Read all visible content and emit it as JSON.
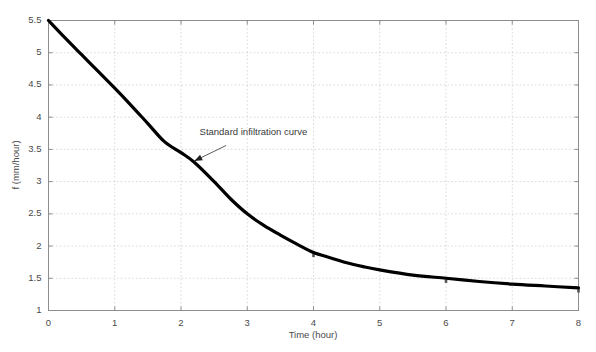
{
  "chart_data": {
    "type": "line",
    "title": "",
    "xlabel": "Time (hour)",
    "ylabel": "f (mm/hour)",
    "xlim": [
      0,
      8
    ],
    "ylim": [
      1,
      5.5
    ],
    "grid": true,
    "legend_position": "none",
    "xticks": [
      0,
      1,
      2,
      3,
      4,
      5,
      6,
      7,
      8
    ],
    "xtick_labels": [
      "0",
      "1",
      "2",
      "3",
      "4",
      "5",
      "6",
      "7",
      "8"
    ],
    "yticks": [
      1,
      1.5,
      2,
      2.5,
      3,
      3.5,
      4,
      4.5,
      5,
      5.5
    ],
    "ytick_labels": [
      "1",
      "1.5",
      "2",
      "2.5",
      "3",
      "3.5",
      "4",
      "4.5",
      "5",
      "5.5"
    ],
    "series": [
      {
        "name": "Standard infiltration curve",
        "color": "#000000",
        "x": [
          0,
          0.25,
          0.5,
          0.75,
          1,
          1.25,
          1.5,
          1.75,
          2,
          2.2,
          2.5,
          2.75,
          3,
          3.25,
          3.5,
          3.75,
          4,
          4.25,
          4.5,
          4.75,
          5,
          5.5,
          6,
          6.5,
          7,
          7.5,
          8
        ],
        "y": [
          5.5,
          5.23,
          4.97,
          4.71,
          4.45,
          4.18,
          3.9,
          3.62,
          3.45,
          3.3,
          3.0,
          2.73,
          2.5,
          2.32,
          2.17,
          2.03,
          1.9,
          1.82,
          1.74,
          1.68,
          1.63,
          1.55,
          1.5,
          1.45,
          1.41,
          1.38,
          1.35
        ]
      }
    ],
    "annotations": [
      {
        "text": "Standard infiltration curve",
        "text_x": 2.28,
        "text_y": 3.72,
        "arrow_from_x": 2.68,
        "arrow_from_y": 3.56,
        "arrow_to_x": 2.2,
        "arrow_to_y": 3.32
      }
    ],
    "markers": [
      {
        "x": 4,
        "y": 1.9
      },
      {
        "x": 6,
        "y": 1.5
      },
      {
        "x": 8,
        "y": 1.35
      }
    ]
  }
}
